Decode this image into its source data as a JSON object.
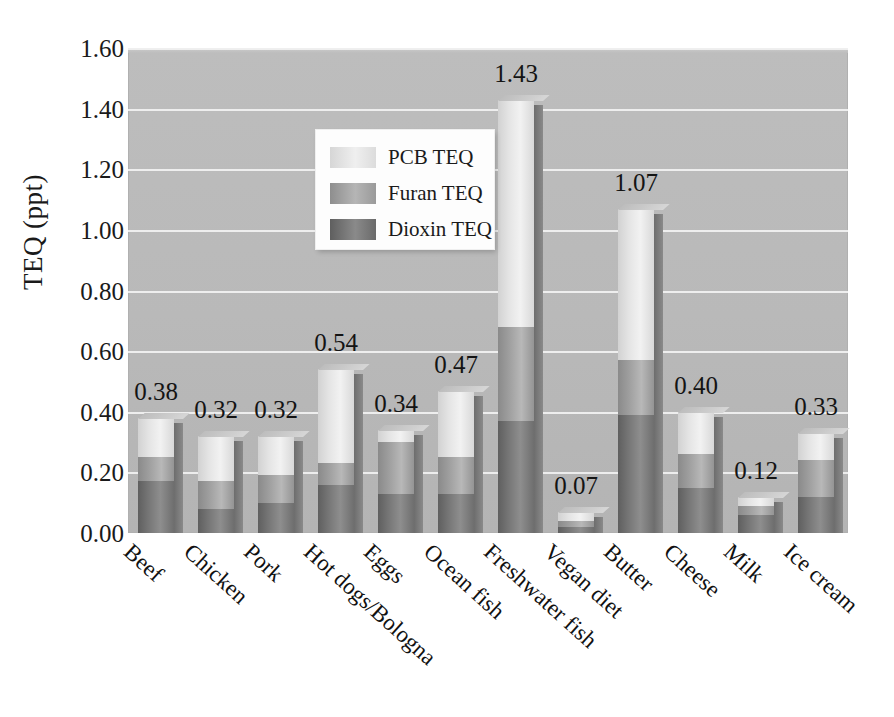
{
  "chart_data": {
    "type": "bar",
    "subtype": "stacked-bar",
    "title": "",
    "xlabel": "",
    "ylabel": "TEQ  (ppt)",
    "ylim": [
      0.0,
      1.6
    ],
    "ytick_labels": [
      "0.00",
      "0.20",
      "0.40",
      "0.60",
      "0.80",
      "1.00",
      "1.20",
      "1.40",
      "1.60"
    ],
    "ytick_values": [
      0.0,
      0.2,
      0.4,
      0.6,
      0.8,
      1.0,
      1.2,
      1.4,
      1.6
    ],
    "grid": true,
    "grid_axis": "y",
    "legend_position": "upper-left-inside",
    "categories": [
      "Beef",
      "Chicken",
      "Pork",
      "Hot dogs/Bologna",
      "Eggs",
      "Ocean fish",
      "Freshwater fish",
      "Vegan diet",
      "Butter",
      "Cheese",
      "Milk",
      "Ice cream"
    ],
    "series": [
      {
        "name": "Dioxin TEQ",
        "color": "#6e6e6e",
        "values": [
          0.17,
          0.08,
          0.1,
          0.16,
          0.13,
          0.13,
          0.37,
          0.02,
          0.39,
          0.15,
          0.06,
          0.12
        ]
      },
      {
        "name": "Furan TEQ",
        "color": "#a0a0a0",
        "values": [
          0.08,
          0.09,
          0.09,
          0.07,
          0.17,
          0.12,
          0.31,
          0.02,
          0.18,
          0.11,
          0.03,
          0.12
        ]
      },
      {
        "name": "PCB TEQ",
        "color": "#e4e4e4",
        "values": [
          0.13,
          0.15,
          0.13,
          0.31,
          0.04,
          0.22,
          0.75,
          0.03,
          0.5,
          0.14,
          0.03,
          0.09
        ]
      }
    ],
    "totals": [
      0.38,
      0.32,
      0.32,
      0.54,
      0.34,
      0.47,
      1.43,
      0.07,
      1.07,
      0.4,
      0.12,
      0.33
    ],
    "total_labels": [
      "0.38",
      "0.32",
      "0.32",
      "0.54",
      "0.34",
      "0.47",
      "1.43",
      "0.07",
      "1.07",
      "0.40",
      "0.12",
      "0.33"
    ],
    "segment_tops": {
      "dioxin": [
        0.17,
        0.08,
        0.1,
        0.16,
        0.13,
        0.13,
        0.37,
        0.02,
        0.39,
        0.15,
        0.06,
        0.12
      ],
      "furan": [
        0.25,
        0.17,
        0.19,
        0.23,
        0.3,
        0.25,
        0.68,
        0.04,
        0.57,
        0.26,
        0.09,
        0.24
      ]
    }
  },
  "legend": {
    "entries": [
      {
        "label": "PCB TEQ",
        "swatch": "pcb"
      },
      {
        "label": "Furan TEQ",
        "swatch": "furan"
      },
      {
        "label": "Dioxin TEQ",
        "swatch": "dioxin"
      }
    ]
  },
  "colors": {
    "plot_background": "#bdbdbd",
    "gridline": "#f0f0f0",
    "page_background": "#ffffff",
    "text": "#1a1a1a",
    "legend_background": "#fdfdfd"
  }
}
